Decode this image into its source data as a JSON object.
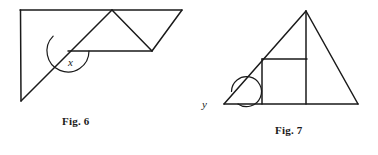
{
  "page": {
    "width": 378,
    "height": 155,
    "background": "#ffffff",
    "ink_color": "#1a1a1a"
  },
  "figures": [
    {
      "id": "fig-6",
      "caption": "Fig. 6",
      "angle_label": "x",
      "description": "Quadrilateral outline with a zigzag of triangles inside; angle x marked at the interior vertex between a horizontal segment and a rising diagonal",
      "vertices": {
        "top_left": [
          20,
          10
        ],
        "top_right": [
          182,
          10
        ],
        "bottom_left": [
          21,
          101
        ],
        "inner_left": [
          68,
          51
        ],
        "apex": [
          112,
          10
        ],
        "notch": [
          152,
          51
        ]
      },
      "segments": [
        {
          "name": "top-edge",
          "from": [
            20,
            10
          ],
          "to": [
            182,
            10
          ]
        },
        {
          "name": "left-edge",
          "from": [
            20,
            10
          ],
          "to": [
            21,
            101
          ]
        },
        {
          "name": "long-diagonal",
          "from": [
            21,
            101
          ],
          "to": [
            112,
            10
          ]
        },
        {
          "name": "zigzag-down",
          "from": [
            112,
            10
          ],
          "to": [
            152,
            51
          ]
        },
        {
          "name": "zigzag-up",
          "from": [
            152,
            51
          ],
          "to": [
            182,
            10
          ]
        },
        {
          "name": "mid-horizontal",
          "from": [
            68,
            51
          ],
          "to": [
            152,
            51
          ]
        }
      ],
      "angle_arc": {
        "vertex": [
          68,
          51
        ],
        "radius": 21,
        "from_deg": 0,
        "to_deg": 225,
        "direction": "clockwise-through-below"
      }
    },
    {
      "id": "fig-7",
      "caption": "Fig. 7",
      "angle_label": "y",
      "description": "Triangle with an inscribed square and a vertical altitude; reflex angle y marked at the left base vertex",
      "vertices": {
        "apex": [
          306,
          11
        ],
        "base_left": [
          224,
          104
        ],
        "base_right": [
          358,
          104
        ]
      },
      "segments": [
        {
          "name": "left-side",
          "from": [
            224,
            104
          ],
          "to": [
            306,
            11
          ]
        },
        {
          "name": "right-side",
          "from": [
            306,
            11
          ],
          "to": [
            358,
            104
          ]
        },
        {
          "name": "base",
          "from": [
            224,
            104
          ],
          "to": [
            358,
            104
          ]
        },
        {
          "name": "altitude",
          "from": [
            306,
            11
          ],
          "to": [
            306,
            104
          ]
        },
        {
          "name": "square-top",
          "from": [
            262,
            59
          ],
          "to": [
            307,
            59
          ]
        },
        {
          "name": "square-left",
          "from": [
            262,
            59
          ],
          "to": [
            262,
            104
          ]
        }
      ],
      "angle_arc": {
        "vertex": [
          224,
          104
        ],
        "radius": 15,
        "type": "reflex-loop"
      }
    }
  ]
}
